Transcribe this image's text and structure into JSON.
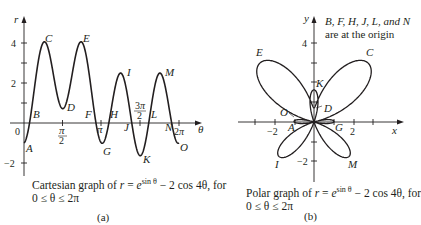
{
  "figure": {
    "panel_a": {
      "caption_line1": "Cartesian graph of r = e^{sin θ} − 2 cos 4θ, for",
      "caption_line2": "0 ≤ θ ≤ 2π",
      "caption_prefix": "Cartesian graph of ",
      "caption_suffix": ", for",
      "sub_label": "(a)",
      "x_axis_label": "θ",
      "y_axis_label": "r",
      "y_ticks": [
        "4",
        "2",
        "−2"
      ],
      "x_ticks": [
        "0",
        "π/2",
        "π",
        "3π/2",
        "2π"
      ],
      "points": [
        "A",
        "B",
        "C",
        "D",
        "E",
        "F",
        "G",
        "H",
        "I",
        "J",
        "K",
        "L",
        "M",
        "N",
        "O"
      ]
    },
    "panel_b": {
      "caption_line1": "Polar graph of r = e^{sin θ} − 2 cos 4θ, for",
      "caption_line2": "0 ≤ θ ≤ 2π",
      "caption_prefix": "Polar graph of ",
      "caption_suffix": ", for",
      "sub_label": "(b)",
      "note_line1": "B, F, H, J, L, and N",
      "note_line2": "are at the origin",
      "x_axis_label": "x",
      "y_axis_label": "y",
      "x_ticks": [
        "−2",
        "2"
      ],
      "y_ticks": [
        "4",
        "−2"
      ],
      "points": [
        "A",
        "C",
        "D",
        "E",
        "G",
        "I",
        "K",
        "M",
        "O"
      ]
    },
    "equation": {
      "lhs": "r",
      "base": "e",
      "exponent": "sin θ",
      "rest": " − 2 cos 4θ"
    }
  },
  "chart_data": [
    {
      "type": "line",
      "title": "Cartesian graph of r = e^{sin θ} − 2 cos 4θ, for 0 ≤ θ ≤ 2π",
      "xlabel": "θ",
      "ylabel": "r",
      "xlim": [
        0,
        6.2832
      ],
      "ylim": [
        -2,
        4.6
      ],
      "x_tick_labels": [
        "0",
        "π/2",
        "π",
        "3π/2",
        "2π"
      ],
      "y_tick_labels": [
        "-2",
        "2",
        "4"
      ],
      "grid": false,
      "function": "r = exp(sin(theta)) - 2*cos(4*theta)",
      "annotated_points": [
        {
          "label": "A",
          "theta": 0.0,
          "r": -1.0
        },
        {
          "label": "B",
          "theta": 0.3,
          "r": 0.0
        },
        {
          "label": "C",
          "theta": 0.8,
          "r": 4.0
        },
        {
          "label": "D",
          "theta": 1.57,
          "r": 0.72
        },
        {
          "label": "E",
          "theta": 2.36,
          "r": 4.0
        },
        {
          "label": "F",
          "theta": 2.8,
          "r": 0.0
        },
        {
          "label": "G",
          "theta": 3.14,
          "r": -1.0
        },
        {
          "label": "H",
          "theta": 3.5,
          "r": 0.0
        },
        {
          "label": "I",
          "theta": 3.93,
          "r": 2.5
        },
        {
          "label": "J",
          "theta": 4.4,
          "r": 0.0
        },
        {
          "label": "K",
          "theta": 4.71,
          "r": -1.63
        },
        {
          "label": "L",
          "theta": 5.0,
          "r": 0.0
        },
        {
          "label": "M",
          "theta": 5.5,
          "r": 2.5
        },
        {
          "label": "N",
          "theta": 5.95,
          "r": 0.0
        },
        {
          "label": "O",
          "theta": 6.28,
          "r": -1.0
        }
      ]
    },
    {
      "type": "line",
      "title": "Polar graph of r = e^{sin θ} − 2 cos 4θ, for 0 ≤ θ ≤ 2π",
      "xlabel": "x",
      "ylabel": "y",
      "xlim": [
        -3.3,
        3.3
      ],
      "ylim": [
        -3.2,
        5
      ],
      "x_tick_labels": [
        "-2",
        "2"
      ],
      "y_tick_labels": [
        "-2",
        "4"
      ],
      "grid": false,
      "function": "polar r = exp(sin(theta)) - 2*cos(4*theta)",
      "annotation": "B, F, H, J, L, and N are at the origin",
      "annotated_points": [
        {
          "label": "A",
          "x": -1.0,
          "y": 0.0
        },
        {
          "label": "C",
          "x": 2.8,
          "y": 2.87
        },
        {
          "label": "D",
          "x": 0.0,
          "y": 0.72
        },
        {
          "label": "E",
          "x": -2.8,
          "y": 2.87
        },
        {
          "label": "G",
          "x": 1.0,
          "y": 0.0
        },
        {
          "label": "I",
          "x": 1.77,
          "y": 1.77
        },
        {
          "label": "K",
          "x": 0.0,
          "y": 1.63
        },
        {
          "label": "M",
          "x": -1.77,
          "y": 1.77
        },
        {
          "label": "O",
          "x": -1.0,
          "y": 0.0
        }
      ]
    }
  ]
}
